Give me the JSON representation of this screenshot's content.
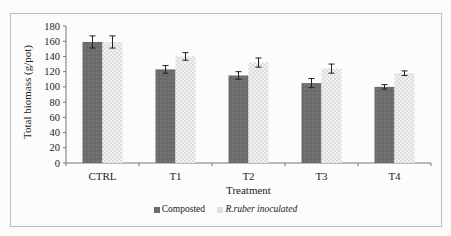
{
  "chart_data": {
    "type": "bar",
    "title": "",
    "xlabel": "Treatment",
    "ylabel": "Total biomass (g/pot)",
    "ylim": [
      0,
      180
    ],
    "yticks": [
      0,
      20,
      40,
      60,
      80,
      100,
      120,
      140,
      160,
      180
    ],
    "categories": [
      "CTRL",
      "T1",
      "T2",
      "T3",
      "T4"
    ],
    "series": [
      {
        "name": "Composted",
        "values": [
          159,
          123,
          115,
          105,
          100
        ],
        "errors": [
          8,
          5,
          5,
          6,
          3
        ],
        "color": "#6b6b6b"
      },
      {
        "name": "R.ruber inoculated",
        "values": [
          159,
          140,
          132,
          124,
          118
        ],
        "errors": [
          8,
          5,
          6,
          6,
          3
        ],
        "color": "#e6e6e6"
      }
    ],
    "grid": false,
    "legend_position": "bottom"
  },
  "labels": {
    "ylabel": "Total biomass (g/pot)",
    "xlabel": "Treatment",
    "legend_composted": "Composted",
    "legend_inoculated": "R.ruber inoculated"
  }
}
